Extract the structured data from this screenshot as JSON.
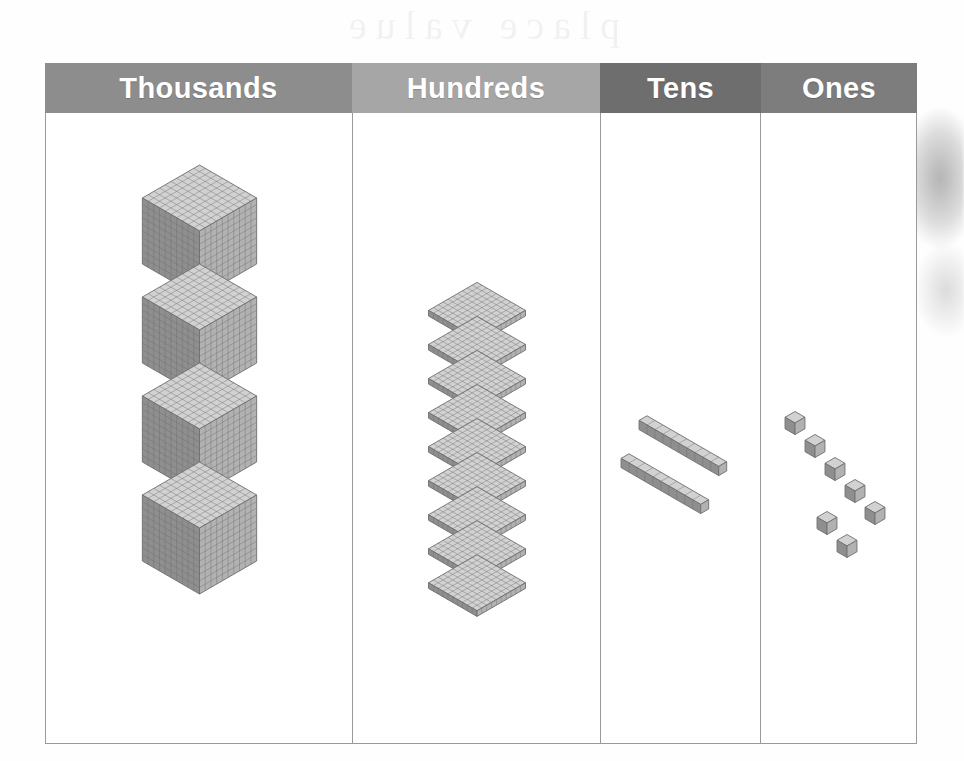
{
  "page": {
    "type": "place-value-chart",
    "title_visible": false,
    "background_color": "#ffffff",
    "border_color": "#9a9a9a"
  },
  "bleed_through": {
    "top_text": "place value",
    "right_text": "hundreds",
    "photo_label": "person-photo-ghost"
  },
  "columns": [
    {
      "label": "Thousands",
      "header_color": "#8d8d8d",
      "header_text_color": "#ffffff",
      "place": 1000,
      "count": 4,
      "block_type": "cube",
      "block_label": "thousand-cube",
      "value": 4000
    },
    {
      "label": "Hundreds",
      "header_color": "#a6a6a6",
      "header_text_color": "#ffffff",
      "place": 100,
      "count": 9,
      "block_type": "flat",
      "block_label": "hundred-flat",
      "value": 900
    },
    {
      "label": "Tens",
      "header_color": "#6e6e6e",
      "header_text_color": "#ffffff",
      "place": 10,
      "count": 2,
      "block_type": "rod",
      "block_label": "ten-rod",
      "value": 20
    },
    {
      "label": "Ones",
      "header_color": "#7d7d7d",
      "header_text_color": "#ffffff",
      "place": 1,
      "count": 7,
      "block_type": "unit",
      "block_label": "one-unit",
      "value": 7
    }
  ],
  "chart_data": {
    "type": "table",
    "categories": [
      "Thousands",
      "Hundreds",
      "Tens",
      "Ones"
    ],
    "values": [
      4,
      9,
      2,
      7
    ],
    "place_values": [
      1000,
      100,
      10,
      1
    ],
    "partial_values": [
      4000,
      900,
      20,
      7
    ],
    "block_types": [
      "cube",
      "flat",
      "rod",
      "unit"
    ],
    "total": 4927,
    "xlabel": "Place",
    "ylabel": "Number of blocks",
    "grid": false,
    "legend": "none"
  }
}
